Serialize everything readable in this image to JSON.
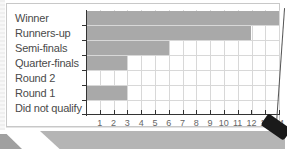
{
  "chart_data": {
    "type": "bar",
    "orientation": "horizontal",
    "title": "",
    "xlabel": "",
    "ylabel": "",
    "categories": [
      "Winner",
      "Runners-up",
      "Semi-finals",
      "Quarter-finals",
      "Round 2",
      "Round 1",
      "Did not qualify"
    ],
    "values": [
      14,
      12,
      6,
      3,
      0,
      3,
      0
    ],
    "xlim": [
      0,
      14
    ],
    "xticks": [
      "1",
      "2",
      "3",
      "4",
      "5",
      "6",
      "7",
      "8",
      "9",
      "10",
      "11",
      "12",
      "13",
      "14"
    ],
    "grid": true,
    "legend": null,
    "bar_color": "#a9a9a9"
  },
  "labels": {
    "row0": "Winner",
    "row1": "Runners-up",
    "row2": "Semi-finals",
    "row3": "Quarter-finals",
    "row4": "Round 2",
    "row5": "Round 1",
    "row6": "Did not qualify"
  },
  "ticks": {
    "t1": "1",
    "t2": "2",
    "t3": "3",
    "t4": "4",
    "t5": "5",
    "t6": "6",
    "t7": "7",
    "t8": "8",
    "t9": "9",
    "t10": "10",
    "t11": "11",
    "t12": "12",
    "t13": "13",
    "t14": "14"
  }
}
